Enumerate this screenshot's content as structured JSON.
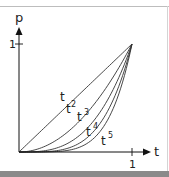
{
  "chart_data": {
    "type": "line",
    "title": "",
    "xlabel": "t",
    "ylabel": "p",
    "xlim": [
      0,
      1
    ],
    "ylim": [
      0,
      1
    ],
    "x_ticks": [
      "1"
    ],
    "y_ticks": [
      "1"
    ],
    "grid": false,
    "legend": "inline labels on curves",
    "series": [
      {
        "name": "t",
        "label": "t",
        "exponent": 1
      },
      {
        "name": "t^2",
        "label": "t²",
        "exponent": 2
      },
      {
        "name": "t^3",
        "label": "t³",
        "exponent": 3
      },
      {
        "name": "t^4",
        "label": "t⁴",
        "exponent": 4
      },
      {
        "name": "t^5",
        "label": "t⁵",
        "exponent": 5
      }
    ]
  },
  "axes": {
    "x_label": "t",
    "y_label": "p",
    "x_tick": "1",
    "y_tick": "1"
  },
  "labels": {
    "t1": "t",
    "t2_base": "t",
    "t2_exp": "2",
    "t3_base": "t",
    "t3_exp": "3",
    "t4_base": "t",
    "t4_exp": "4",
    "t5_base": "t",
    "t5_exp": "5"
  },
  "colors": {
    "line": "#333333",
    "axis": "#111111"
  }
}
